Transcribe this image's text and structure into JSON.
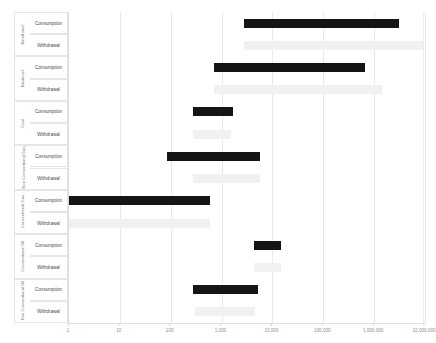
{
  "chart_data": {
    "type": "bar",
    "orientation": "horizontal",
    "title": "",
    "xlabel": "",
    "ylabel": "",
    "xscale": "log",
    "xlim": [
      1,
      10000000
    ],
    "grid": true,
    "legend_position": "none",
    "xticks": [
      {
        "value": 1,
        "label": "1"
      },
      {
        "value": 10,
        "label": "10"
      },
      {
        "value": 100,
        "label": "100"
      },
      {
        "value": 1000,
        "label": "1,000"
      },
      {
        "value": 10000,
        "label": "10,000"
      },
      {
        "value": 100000,
        "label": "100,000"
      },
      {
        "value": 1000000,
        "label": "1,000,000"
      },
      {
        "value": 10000000,
        "label": "10,000,000"
      }
    ],
    "series": [
      {
        "name": "Consumption",
        "color": "#151515"
      },
      {
        "name": "Withdrawal",
        "color": "#f1f1f1"
      }
    ],
    "groups": [
      {
        "group": "Bioethanol",
        "rows": [
          {
            "metric": "Consumption",
            "low": 2700,
            "high": 3100000
          },
          {
            "metric": "Withdrawal",
            "low": 2700,
            "high": 9000000
          }
        ]
      },
      {
        "group": "Biodiesel",
        "rows": [
          {
            "metric": "Consumption",
            "low": 720,
            "high": 660000
          },
          {
            "metric": "Withdrawal",
            "low": 720,
            "high": 1400000
          }
        ]
      },
      {
        "group": "Coal",
        "rows": [
          {
            "metric": "Consumption",
            "low": 270,
            "high": 1700
          },
          {
            "metric": "Withdrawal",
            "low": 270,
            "high": 1500
          }
        ]
      },
      {
        "group": "Non Conventional Gas",
        "rows": [
          {
            "metric": "Consumption",
            "low": 83,
            "high": 5700
          },
          {
            "metric": "Withdrawal",
            "low": 280,
            "high": 5700
          }
        ]
      },
      {
        "group": "Conventional Gas",
        "rows": [
          {
            "metric": "Consumption",
            "low": 1,
            "high": 600
          },
          {
            "metric": "Withdrawal",
            "low": 1,
            "high": 600
          }
        ]
      },
      {
        "group": "Conventional Oil",
        "rows": [
          {
            "metric": "Consumption",
            "low": 4300,
            "high": 14500
          },
          {
            "metric": "Withdrawal",
            "low": 4300,
            "high": 14500
          }
        ]
      },
      {
        "group": "Non Conventional Oil",
        "rows": [
          {
            "metric": "Consumption",
            "low": 270,
            "high": 5200
          },
          {
            "metric": "Withdrawal",
            "low": 300,
            "high": 4600
          }
        ]
      }
    ]
  },
  "axis": {
    "group_labels": [
      "Bioethanol",
      "Biodiesel",
      "Coal",
      "Non Conventional Gas",
      "Conventional Gas",
      "Conventional Oil",
      "Non Conventional Oil"
    ],
    "metric_labels": [
      "Consumption",
      "Withdrawal"
    ]
  },
  "top_stub": {
    "items": [
      "",
      ""
    ]
  }
}
